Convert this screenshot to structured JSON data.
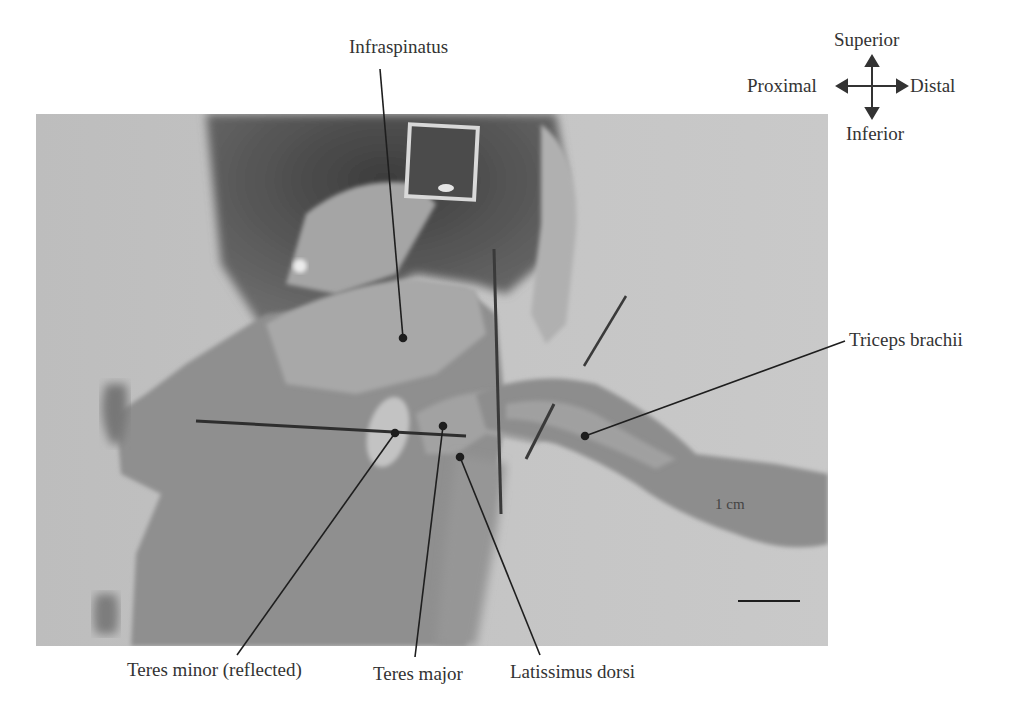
{
  "figure": {
    "type": "labeled anatomical photograph",
    "background_color": "#ffffff",
    "photo": {
      "x": 36,
      "y": 114,
      "width": 792,
      "height": 532,
      "tone": "grayscale"
    }
  },
  "orientation": {
    "superior": "Superior",
    "inferior": "Inferior",
    "proximal": "Proximal",
    "distal": "Distal"
  },
  "scale_bar": {
    "label": "1 cm",
    "length_px": 62
  },
  "labels": [
    {
      "id": "infraspinatus",
      "text": "Infraspinatus",
      "text_x": 349,
      "text_y": 37,
      "point": [
        403,
        338
      ],
      "anchor": [
        380,
        69
      ]
    },
    {
      "id": "triceps-brachii",
      "text": "Triceps brachii",
      "text_x": 849,
      "text_y": 330,
      "point": [
        585,
        436
      ],
      "anchor": [
        845,
        341
      ]
    },
    {
      "id": "teres-minor",
      "text": "Teres minor (reflected)",
      "text_x": 127,
      "text_y": 660,
      "point": [
        395,
        433
      ],
      "anchor": [
        237,
        655
      ]
    },
    {
      "id": "teres-major",
      "text": "Teres major",
      "text_x": 373,
      "text_y": 664,
      "point": [
        443,
        426
      ],
      "anchor": [
        415,
        657
      ]
    },
    {
      "id": "latissimus-dorsi",
      "text": "Latissimus dorsi",
      "text_x": 470,
      "text_y": 662,
      "point": [
        460,
        457
      ],
      "anchor": [
        540,
        655
      ]
    }
  ],
  "colors": {
    "label_text": "#333333",
    "leader_line": "#1e1e1e",
    "background_gray": "#b9b9b9",
    "specimen_gray": "#9a9a9a",
    "dark_tissue": "#4a4a4a"
  }
}
